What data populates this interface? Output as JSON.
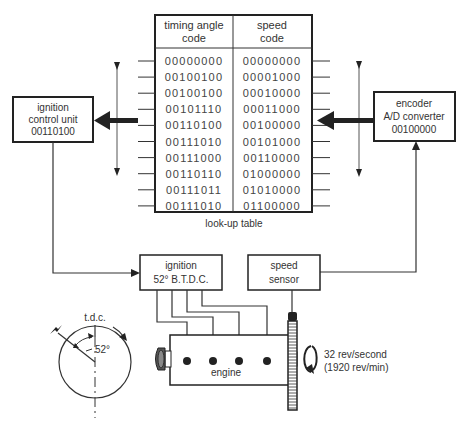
{
  "lookup_table": {
    "caption": "look-up table",
    "headers": [
      {
        "line1": "timing angle",
        "line2": "code"
      },
      {
        "line1": "speed",
        "line2": "code"
      }
    ],
    "rows": [
      {
        "timing": "00000000",
        "speed": "00000000"
      },
      {
        "timing": "00100100",
        "speed": "00001000"
      },
      {
        "timing": "00100100",
        "speed": "00010000"
      },
      {
        "timing": "00101110",
        "speed": "00011000"
      },
      {
        "timing": "00110100",
        "speed": "00100000"
      },
      {
        "timing": "00111010",
        "speed": "00101000"
      },
      {
        "timing": "00111000",
        "speed": "00110000"
      },
      {
        "timing": "00110110",
        "speed": "01000000"
      },
      {
        "timing": "00111011",
        "speed": "01010000"
      },
      {
        "timing": "00111010",
        "speed": "01100000"
      }
    ],
    "selected_row": 4
  },
  "ignition_control_unit": {
    "line1": "ignition",
    "line2": "control unit",
    "line3": "00110100"
  },
  "encoder": {
    "line1": "encoder",
    "line2": "A/D converter",
    "line3": "00100000"
  },
  "ignition": {
    "line1": "ignition",
    "line2": "52° B.T.D.C."
  },
  "speed_sensor": {
    "line1": "speed",
    "line2": "sensor"
  },
  "engine": {
    "label": "engine",
    "spark_plugs": 4
  },
  "rotation": {
    "line1": "32 rev/second",
    "line2": "(1920 rev/min)"
  },
  "timing_dial": {
    "tdc_label": "t.d.c.",
    "angle_label": "52°"
  }
}
